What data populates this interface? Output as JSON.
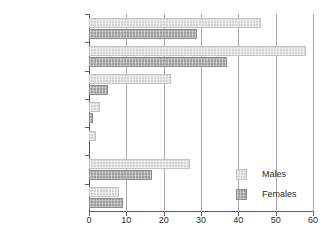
{
  "chart_data": {
    "type": "bar",
    "orientation": "horizontal",
    "title": "",
    "subtitle": "",
    "xlabel": "",
    "ylabel": "",
    "xlim": [
      0,
      60
    ],
    "xticks": [
      0,
      10,
      20,
      30,
      40,
      50,
      60
    ],
    "grid": "vertical",
    "legend_position": "inside-bottom-right",
    "categories": [
      "General population",
      "White Irish",
      "Indian",
      "Pakistani",
      "Bangladeshi",
      "Black Caribbean",
      "Chinese"
    ],
    "category_footnotes": [
      "†",
      "",
      "",
      "",
      "",
      "",
      ""
    ],
    "series": [
      {
        "name": "Males",
        "color": "#d3d3d3",
        "values": [
          46,
          58,
          22,
          3,
          2,
          27,
          8
        ]
      },
      {
        "name": "Females",
        "color": "#9c9c9c",
        "values": [
          29,
          37,
          5,
          1,
          0,
          17,
          9
        ]
      }
    ]
  },
  "legend": {
    "entries": [
      {
        "label": "Males"
      },
      {
        "label": "Females"
      }
    ]
  },
  "axis": {
    "x_tick_labels": [
      "0",
      "10",
      "20",
      "30",
      "40",
      "50",
      "60"
    ]
  }
}
